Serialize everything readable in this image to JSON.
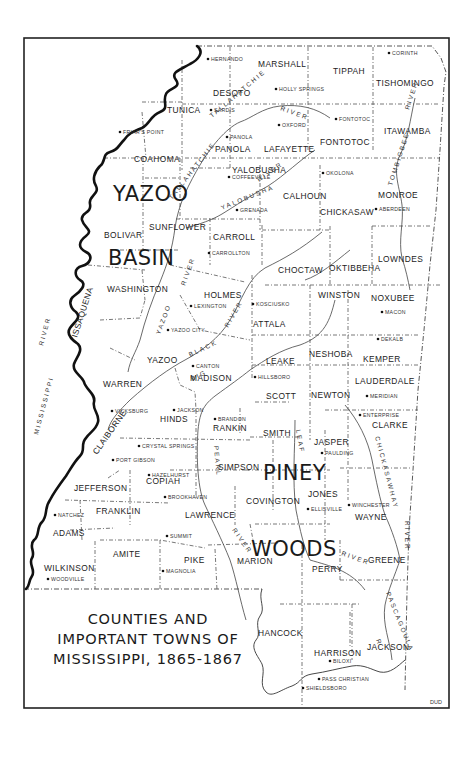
{
  "map": {
    "title_lines": [
      "COUNTIES AND",
      "IMPORTANT TOWNS OF",
      "MISSISSIPPI, 1865-1867"
    ],
    "credit": "DUD",
    "regions": [
      {
        "label": "YAZOO",
        "x": 113,
        "y": 201
      },
      {
        "label": "BASIN",
        "x": 108,
        "y": 265
      },
      {
        "label": "PINEY",
        "x": 263,
        "y": 480
      },
      {
        "label": "WOODS",
        "x": 251,
        "y": 556
      }
    ],
    "counties": [
      {
        "name": "MARSHALL",
        "x": 258,
        "y": 67
      },
      {
        "name": "TIPPAH",
        "x": 333,
        "y": 74
      },
      {
        "name": "TISHOMINGO",
        "x": 376,
        "y": 86
      },
      {
        "name": "DESOTO",
        "x": 213,
        "y": 96
      },
      {
        "name": "TUNICA",
        "x": 167,
        "y": 113
      },
      {
        "name": "PANOLA",
        "x": 215,
        "y": 152
      },
      {
        "name": "LAFAYETTE",
        "x": 264,
        "y": 152
      },
      {
        "name": "FONTOTOC",
        "x": 320,
        "y": 145
      },
      {
        "name": "ITAWAMBA",
        "x": 384,
        "y": 134
      },
      {
        "name": "COAHOMA",
        "x": 134,
        "y": 162
      },
      {
        "name": "YALOBUSHA",
        "x": 232,
        "y": 173
      },
      {
        "name": "CALHOUN",
        "x": 283,
        "y": 199
      },
      {
        "name": "MONROE",
        "x": 378,
        "y": 198
      },
      {
        "name": "CHICKASAW",
        "x": 320,
        "y": 215
      },
      {
        "name": "BOLIVAR",
        "x": 104,
        "y": 238
      },
      {
        "name": "SUNFLOWER",
        "x": 149,
        "y": 230
      },
      {
        "name": "CARROLL",
        "x": 213,
        "y": 240
      },
      {
        "name": "LOWNDES",
        "x": 378,
        "y": 262
      },
      {
        "name": "CHOCTAW",
        "x": 278,
        "y": 273
      },
      {
        "name": "OKTIBBEHA",
        "x": 329,
        "y": 271
      },
      {
        "name": "WASHINGTON",
        "x": 107,
        "y": 292
      },
      {
        "name": "HOLMES",
        "x": 204,
        "y": 298
      },
      {
        "name": "WINSTON",
        "x": 318,
        "y": 298
      },
      {
        "name": "NOXUBEE",
        "x": 371,
        "y": 301
      },
      {
        "name": "ATTALA",
        "x": 253,
        "y": 327
      },
      {
        "name": "YAZOO",
        "x": 147,
        "y": 363
      },
      {
        "name": "ISSAQUENA",
        "x": 77,
        "y": 338,
        "rotate": -72
      },
      {
        "name": "LEAKE",
        "x": 266,
        "y": 364
      },
      {
        "name": "NESHOBA",
        "x": 309,
        "y": 357
      },
      {
        "name": "KEMPER",
        "x": 363,
        "y": 362
      },
      {
        "name": "WARREN",
        "x": 103,
        "y": 387
      },
      {
        "name": "MADISON",
        "x": 190,
        "y": 381
      },
      {
        "name": "LAUDERDALE",
        "x": 355,
        "y": 384
      },
      {
        "name": "SCOTT",
        "x": 266,
        "y": 399
      },
      {
        "name": "NEWTON",
        "x": 311,
        "y": 398
      },
      {
        "name": "HINDS",
        "x": 160,
        "y": 422
      },
      {
        "name": "RANKIN",
        "x": 213,
        "y": 431
      },
      {
        "name": "CLARKE",
        "x": 372,
        "y": 428
      },
      {
        "name": "SMITH",
        "x": 263,
        "y": 436
      },
      {
        "name": "JASPER",
        "x": 314,
        "y": 445
      },
      {
        "name": "CLAIBORNE",
        "x": 97,
        "y": 455,
        "rotate": -55
      },
      {
        "name": "SIMPSON",
        "x": 218,
        "y": 470
      },
      {
        "name": "COPIAH",
        "x": 146,
        "y": 484
      },
      {
        "name": "JEFFERSON",
        "x": 74,
        "y": 491
      },
      {
        "name": "COVINGTON",
        "x": 246,
        "y": 504
      },
      {
        "name": "JONES",
        "x": 308,
        "y": 497
      },
      {
        "name": "WAYNE",
        "x": 355,
        "y": 520
      },
      {
        "name": "FRANKLIN",
        "x": 96,
        "y": 514
      },
      {
        "name": "LAWRENCE",
        "x": 185,
        "y": 518
      },
      {
        "name": "ADAMS",
        "x": 53,
        "y": 536
      },
      {
        "name": "AMITE",
        "x": 113,
        "y": 557
      },
      {
        "name": "PIKE",
        "x": 184,
        "y": 563
      },
      {
        "name": "MARION",
        "x": 237,
        "y": 564
      },
      {
        "name": "PERRY",
        "x": 312,
        "y": 572
      },
      {
        "name": "GREENE",
        "x": 368,
        "y": 563
      },
      {
        "name": "WILKINSON",
        "x": 44,
        "y": 571
      },
      {
        "name": "HANCOCK",
        "x": 258,
        "y": 636
      },
      {
        "name": "HARRISON",
        "x": 314,
        "y": 656
      },
      {
        "name": "JACKSON",
        "x": 367,
        "y": 650
      }
    ],
    "towns": [
      {
        "name": "HERNANDO",
        "x": 211,
        "y": 61,
        "dx": 0,
        "dy": 3
      },
      {
        "name": "CORINTH",
        "x": 392,
        "y": 55
      },
      {
        "name": "HOLLY SPRINGS",
        "x": 279,
        "y": 91
      },
      {
        "name": "SARDIS",
        "x": 214,
        "y": 112
      },
      {
        "name": "FONTOTOC",
        "x": 339,
        "y": 121
      },
      {
        "name": "OXFORD",
        "x": 282,
        "y": 127
      },
      {
        "name": "FRIAR'S POINT",
        "x": 123,
        "y": 134
      },
      {
        "name": "PANOLA",
        "x": 230,
        "y": 139
      },
      {
        "name": "COFFEEVILLE",
        "x": 232,
        "y": 179
      },
      {
        "name": "OKOLONA",
        "x": 326,
        "y": 175
      },
      {
        "name": "ABERDEEN",
        "x": 379,
        "y": 211
      },
      {
        "name": "GRENADA",
        "x": 240,
        "y": 212
      },
      {
        "name": "CARROLLTON",
        "x": 212,
        "y": 255
      },
      {
        "name": "LEXINGTON",
        "x": 194,
        "y": 308
      },
      {
        "name": "KOSCIUSKO",
        "x": 256,
        "y": 306
      },
      {
        "name": "MACON",
        "x": 385,
        "y": 314
      },
      {
        "name": "YAZOO CITY",
        "x": 171,
        "y": 332
      },
      {
        "name": "DEKALB",
        "x": 381,
        "y": 341
      },
      {
        "name": "CANTON",
        "x": 196,
        "y": 368
      },
      {
        "name": "HILLSBORO",
        "x": 258,
        "y": 379
      },
      {
        "name": "MERIDIAN",
        "x": 370,
        "y": 398
      },
      {
        "name": "VICKSBURG",
        "x": 115,
        "y": 413
      },
      {
        "name": "JACKSON",
        "x": 177,
        "y": 412
      },
      {
        "name": "BRANDON",
        "x": 218,
        "y": 421
      },
      {
        "name": "ENTERPRISE",
        "x": 363,
        "y": 417
      },
      {
        "name": "PAULDING",
        "x": 325,
        "y": 455
      },
      {
        "name": "CRYSTAL SPRINGS",
        "x": 142,
        "y": 448
      },
      {
        "name": "PORT GIBSON",
        "x": 116,
        "y": 462
      },
      {
        "name": "HAZELHURST",
        "x": 152,
        "y": 477
      },
      {
        "name": "ELLISVILLE",
        "x": 311,
        "y": 511
      },
      {
        "name": "WINCHESTER",
        "x": 352,
        "y": 507
      },
      {
        "name": "BROOKHAVEN",
        "x": 168,
        "y": 499
      },
      {
        "name": "NATCHEZ",
        "x": 58,
        "y": 517
      },
      {
        "name": "SUMMIT",
        "x": 170,
        "y": 538
      },
      {
        "name": "MAGNOLIA",
        "x": 166,
        "y": 573
      },
      {
        "name": "WOODVILLE",
        "x": 51,
        "y": 581
      },
      {
        "name": "BILOXI",
        "x": 333,
        "y": 663
      },
      {
        "name": "PASS CHRISTIAN",
        "x": 322,
        "y": 681
      },
      {
        "name": "SHIELDSBORO",
        "x": 306,
        "y": 690
      }
    ],
    "rivers": [
      {
        "label": "MISSISSIPPI",
        "x": 38,
        "y": 435,
        "rotate": -75
      },
      {
        "label": "RIVER",
        "x": 43,
        "y": 346,
        "rotate": -75
      },
      {
        "label": "TALLAHATCHIE",
        "x": 212,
        "y": 118,
        "rotate": -40
      },
      {
        "label": "RIVER",
        "x": 280,
        "y": 110,
        "rotate": 20
      },
      {
        "label": "TALLAHATCHIE",
        "x": 172,
        "y": 200,
        "rotate": -52
      },
      {
        "label": "YALOBUSHA",
        "x": 222,
        "y": 210,
        "rotate": -22
      },
      {
        "label": "RIVER",
        "x": 259,
        "y": 182,
        "rotate": -35
      },
      {
        "label": "TOMBIGBEE",
        "x": 392,
        "y": 186,
        "rotate": -72
      },
      {
        "label": "RIVER",
        "x": 409,
        "y": 110,
        "rotate": -72
      },
      {
        "label": "RIVER",
        "x": 185,
        "y": 286,
        "rotate": -70
      },
      {
        "label": "YAZOO",
        "x": 160,
        "y": 335,
        "rotate": -70
      },
      {
        "label": "BIG",
        "x": 192,
        "y": 381,
        "rotate": -25
      },
      {
        "label": "BLACK",
        "x": 190,
        "y": 357,
        "rotate": -25
      },
      {
        "label": "RIVER",
        "x": 228,
        "y": 328,
        "rotate": -60
      },
      {
        "label": "LEAF",
        "x": 296,
        "y": 430,
        "rotate": 80
      },
      {
        "label": "PEARL",
        "x": 214,
        "y": 446,
        "rotate": 85
      },
      {
        "label": "CHICKASAWHAY",
        "x": 375,
        "y": 437,
        "rotate": 75
      },
      {
        "label": "RIVER",
        "x": 405,
        "y": 521,
        "rotate": 90
      },
      {
        "label": "RIVER",
        "x": 232,
        "y": 530,
        "rotate": 55
      },
      {
        "label": "RIVER",
        "x": 341,
        "y": 555,
        "rotate": 20
      },
      {
        "label": "PASCAGOULA",
        "x": 386,
        "y": 593,
        "rotate": 68
      },
      {
        "label": "R.",
        "x": 376,
        "y": 640,
        "rotate": 70
      }
    ]
  }
}
